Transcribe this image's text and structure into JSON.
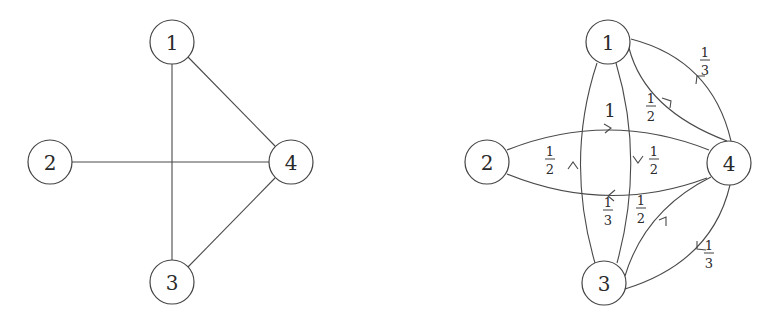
{
  "left_graph": {
    "type": "undirected",
    "nodes": [
      {
        "id": "1",
        "label": "1"
      },
      {
        "id": "2",
        "label": "2"
      },
      {
        "id": "3",
        "label": "3"
      },
      {
        "id": "4",
        "label": "4"
      }
    ],
    "edges": [
      {
        "from": "1",
        "to": "3"
      },
      {
        "from": "1",
        "to": "4"
      },
      {
        "from": "2",
        "to": "4"
      },
      {
        "from": "3",
        "to": "4"
      }
    ]
  },
  "right_graph": {
    "type": "directed-weighted",
    "nodes": [
      {
        "id": "1",
        "label": "1"
      },
      {
        "id": "2",
        "label": "2"
      },
      {
        "id": "3",
        "label": "3"
      },
      {
        "id": "4",
        "label": "4"
      }
    ],
    "edges": [
      {
        "from": "2",
        "to": "4",
        "weight": "1",
        "num": "1",
        "den": ""
      },
      {
        "from": "4",
        "to": "2",
        "weight": "1/3",
        "num": "1",
        "den": "3"
      },
      {
        "from": "1",
        "to": "3",
        "weight": "1/2",
        "num": "1",
        "den": "2"
      },
      {
        "from": "3",
        "to": "1",
        "weight": "1/2",
        "num": "1",
        "den": "2"
      },
      {
        "from": "1",
        "to": "4",
        "weight": "1/2",
        "num": "1",
        "den": "2"
      },
      {
        "from": "4",
        "to": "1",
        "weight": "1/3",
        "num": "1",
        "den": "3"
      },
      {
        "from": "3",
        "to": "4",
        "weight": "1/2",
        "num": "1",
        "den": "2"
      },
      {
        "from": "4",
        "to": "3",
        "weight": "1/3",
        "num": "1",
        "den": "3"
      }
    ]
  }
}
